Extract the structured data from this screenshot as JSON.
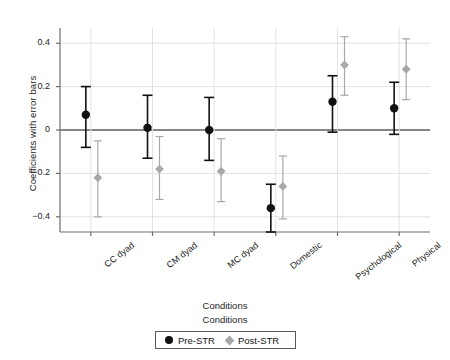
{
  "chart_data": {
    "type": "scatter",
    "title": "",
    "xlabel": "Conditions",
    "ylabel": "Coefficients with error bars",
    "categories": [
      "CC dyad",
      "CM dyad",
      "MC dyad",
      "Domestic",
      "Psychological",
      "Physical"
    ],
    "ylim": [
      -0.47,
      0.47
    ],
    "yticks": [
      0.4,
      0.2,
      0,
      -0.2,
      -0.4
    ],
    "ytick_labels": [
      "0.4",
      "0.2",
      "0",
      "−0.2",
      "−0.4"
    ],
    "grid": "horizontal-and-vertical",
    "legend_position": "bottom",
    "legend_title": "Conditions",
    "zero_line": 0,
    "series": [
      {
        "name": "Pre-STR",
        "marker": "circle",
        "color": "#111111",
        "values": [
          0.07,
          0.01,
          0.0,
          -0.36,
          0.13,
          0.1
        ],
        "err_low": [
          -0.08,
          -0.13,
          -0.14,
          -0.47,
          -0.01,
          -0.02
        ],
        "err_high": [
          0.2,
          0.16,
          0.15,
          -0.25,
          0.25,
          0.22
        ]
      },
      {
        "name": "Post-STR",
        "marker": "diamond",
        "color": "#a8a8a8",
        "values": [
          -0.22,
          -0.18,
          -0.19,
          -0.26,
          0.3,
          0.28
        ],
        "err_low": [
          -0.4,
          -0.32,
          -0.33,
          -0.41,
          0.16,
          0.14
        ],
        "err_high": [
          -0.05,
          -0.03,
          -0.04,
          -0.12,
          0.43,
          0.42
        ]
      }
    ]
  },
  "axis": {
    "y_title": "Coefficients with error bars",
    "x_title": "Conditions"
  },
  "legend": {
    "title": "Conditions",
    "entries": [
      {
        "label": "Pre-STR",
        "color": "#111111",
        "marker": "circle"
      },
      {
        "label": "Post-STR",
        "color": "#a8a8a8",
        "marker": "diamond"
      }
    ]
  },
  "colors": {
    "pre_str": "#111111",
    "post_str": "#a8a8a8",
    "grid": "#e2e2e2",
    "axis": "#6e6e6e",
    "zero_line": "#5e5e5e"
  }
}
